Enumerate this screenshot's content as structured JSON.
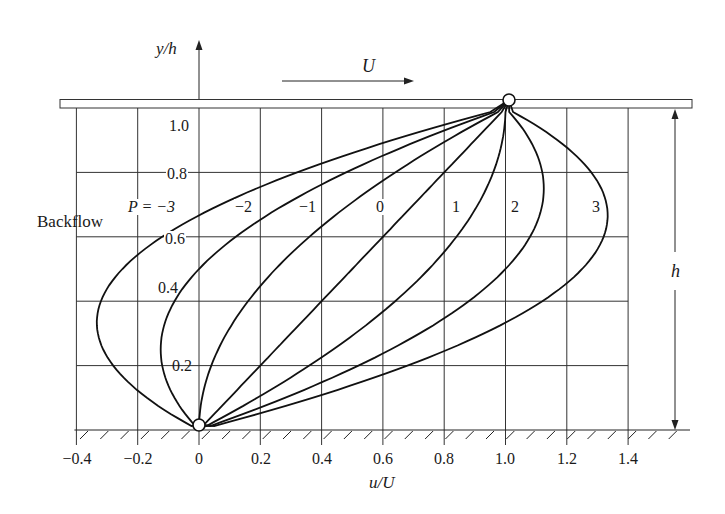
{
  "chart_data": {
    "type": "line",
    "title": "",
    "xlabel": "u/U",
    "ylabel": "y/h",
    "xlim": [
      -0.4,
      1.4
    ],
    "ylim": [
      0,
      1.0
    ],
    "grid": true,
    "x_ticks": [
      "-0.4",
      "-0.2",
      "0",
      "0.2",
      "0.4",
      "0.6",
      "0.8",
      "1.0",
      "1.2",
      "1.4"
    ],
    "x_tick_values": [
      -0.4,
      -0.2,
      0,
      0.2,
      0.4,
      0.6,
      0.8,
      1.0,
      1.2,
      1.4
    ],
    "y_ticks": [
      "0.2",
      "0.4",
      "0.6",
      "0.8",
      "1.0"
    ],
    "y_tick_values": [
      0.2,
      0.4,
      0.6,
      0.8,
      1.0
    ],
    "formula": "u/U = y/h + P (y/h)(1 - y/h)",
    "series": [
      {
        "name": "P=-3",
        "P": -3,
        "y": [
          0,
          0.2,
          0.333,
          0.4,
          0.6,
          0.8,
          1.0
        ],
        "x": [
          0,
          -0.28,
          -0.333,
          -0.32,
          -0.12,
          0.32,
          1.0
        ]
      },
      {
        "name": "P=-2",
        "P": -2,
        "y": [
          0,
          0.2,
          0.25,
          0.4,
          0.6,
          0.8,
          1.0
        ],
        "x": [
          0,
          -0.12,
          -0.125,
          -0.08,
          0.12,
          0.48,
          1.0
        ]
      },
      {
        "name": "P=-1",
        "P": -1,
        "y": [
          0,
          0.2,
          0.4,
          0.6,
          0.8,
          1.0
        ],
        "x": [
          0,
          0.04,
          0.16,
          0.36,
          0.64,
          1.0
        ]
      },
      {
        "name": "P=0",
        "P": 0,
        "y": [
          0,
          0.2,
          0.4,
          0.6,
          0.8,
          1.0
        ],
        "x": [
          0,
          0.2,
          0.4,
          0.6,
          0.8,
          1.0
        ]
      },
      {
        "name": "P=1",
        "P": 1,
        "y": [
          0,
          0.2,
          0.4,
          0.6,
          0.8,
          1.0
        ],
        "x": [
          0,
          0.36,
          0.64,
          0.84,
          0.96,
          1.0
        ]
      },
      {
        "name": "P=2",
        "P": 2,
        "y": [
          0,
          0.2,
          0.4,
          0.6,
          0.75,
          0.8,
          1.0
        ],
        "x": [
          0,
          0.52,
          0.88,
          1.08,
          1.125,
          1.12,
          1.0
        ]
      },
      {
        "name": "P=3",
        "P": 3,
        "y": [
          0,
          0.2,
          0.4,
          0.6,
          0.667,
          0.8,
          1.0
        ],
        "x": [
          0,
          0.68,
          1.12,
          1.32,
          1.333,
          1.28,
          1.0
        ]
      }
    ],
    "annotations": [
      {
        "text": "Backflow",
        "near": "P=-3 curve, left side"
      },
      {
        "text": "U",
        "meaning": "upper plate velocity arrow pointing right"
      },
      {
        "text": "h",
        "meaning": "channel height dimension arrow on right"
      }
    ]
  },
  "labels": {
    "y_axis": "y/h",
    "x_axis": "u/U",
    "plate_velocity": "U",
    "height": "h",
    "backflow": "Backflow",
    "curve_labels": [
      "P = −3",
      "−2",
      "−1",
      "0",
      "1",
      "2",
      "3"
    ],
    "x_ticks": [
      "−0.4",
      "−0.2",
      "0",
      "0.2",
      "0.4",
      "0.6",
      "0.8",
      "1.0",
      "1.2",
      "1.4"
    ],
    "y_ticks": [
      "1.0",
      "0.8",
      "0.6",
      "0.4",
      "0.2"
    ]
  },
  "style": {
    "line_color": "#1a1a1a",
    "grid_color": "#333333",
    "background": "#ffffff"
  }
}
